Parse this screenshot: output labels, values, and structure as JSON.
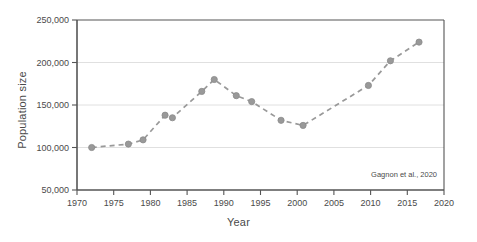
{
  "chart_data": {
    "type": "line",
    "title": "",
    "xlabel": "Year",
    "ylabel": "Population size",
    "xlim": [
      1970,
      2020
    ],
    "ylim": [
      50000,
      250000
    ],
    "xticks": [
      1970,
      1975,
      1980,
      1985,
      1990,
      1995,
      2000,
      2005,
      2010,
      2015,
      2020
    ],
    "xtick_labels": [
      "1970",
      "1975",
      "1980",
      "1985",
      "1990",
      "1995",
      "2000",
      "2005",
      "2010",
      "2015",
      "2020"
    ],
    "yticks": [
      50000,
      100000,
      150000,
      200000,
      250000
    ],
    "ytick_labels": [
      "50,000",
      "100,000",
      "150,000",
      "200,000",
      "250,000"
    ],
    "grid": "horizontal",
    "legend": "none",
    "linestyle": "dashed",
    "marker": "circle",
    "series_color": "#999999",
    "annotation": "Gagnon et al., 2020",
    "x": [
      1972.0,
      1977.0,
      1979.0,
      1982.0,
      1983.0,
      1987.0,
      1988.7,
      1991.7,
      1993.8,
      1997.8,
      2000.8,
      2009.7,
      2012.7,
      2016.6
    ],
    "values": [
      100000,
      104000,
      109000,
      138000,
      135000,
      166000,
      180000,
      161000,
      154000,
      132000,
      126000,
      173000,
      202000,
      224000
    ],
    "points": [
      {
        "x": 1972.0,
        "y": 100000
      },
      {
        "x": 1977.0,
        "y": 104000
      },
      {
        "x": 1979.0,
        "y": 109000
      },
      {
        "x": 1982.0,
        "y": 138000
      },
      {
        "x": 1983.0,
        "y": 135000
      },
      {
        "x": 1987.0,
        "y": 166000
      },
      {
        "x": 1988.7,
        "y": 180000
      },
      {
        "x": 1991.7,
        "y": 161000
      },
      {
        "x": 1993.8,
        "y": 154000
      },
      {
        "x": 1997.8,
        "y": 132000
      },
      {
        "x": 2000.8,
        "y": 126000
      },
      {
        "x": 2009.7,
        "y": 173000
      },
      {
        "x": 2012.7,
        "y": 202000
      },
      {
        "x": 2016.6,
        "y": 224000
      }
    ]
  },
  "colors": {
    "series": "#999999",
    "axis": "#555555",
    "grid": "#dddddd",
    "text": "#4a4a4a",
    "background": "#ffffff"
  }
}
